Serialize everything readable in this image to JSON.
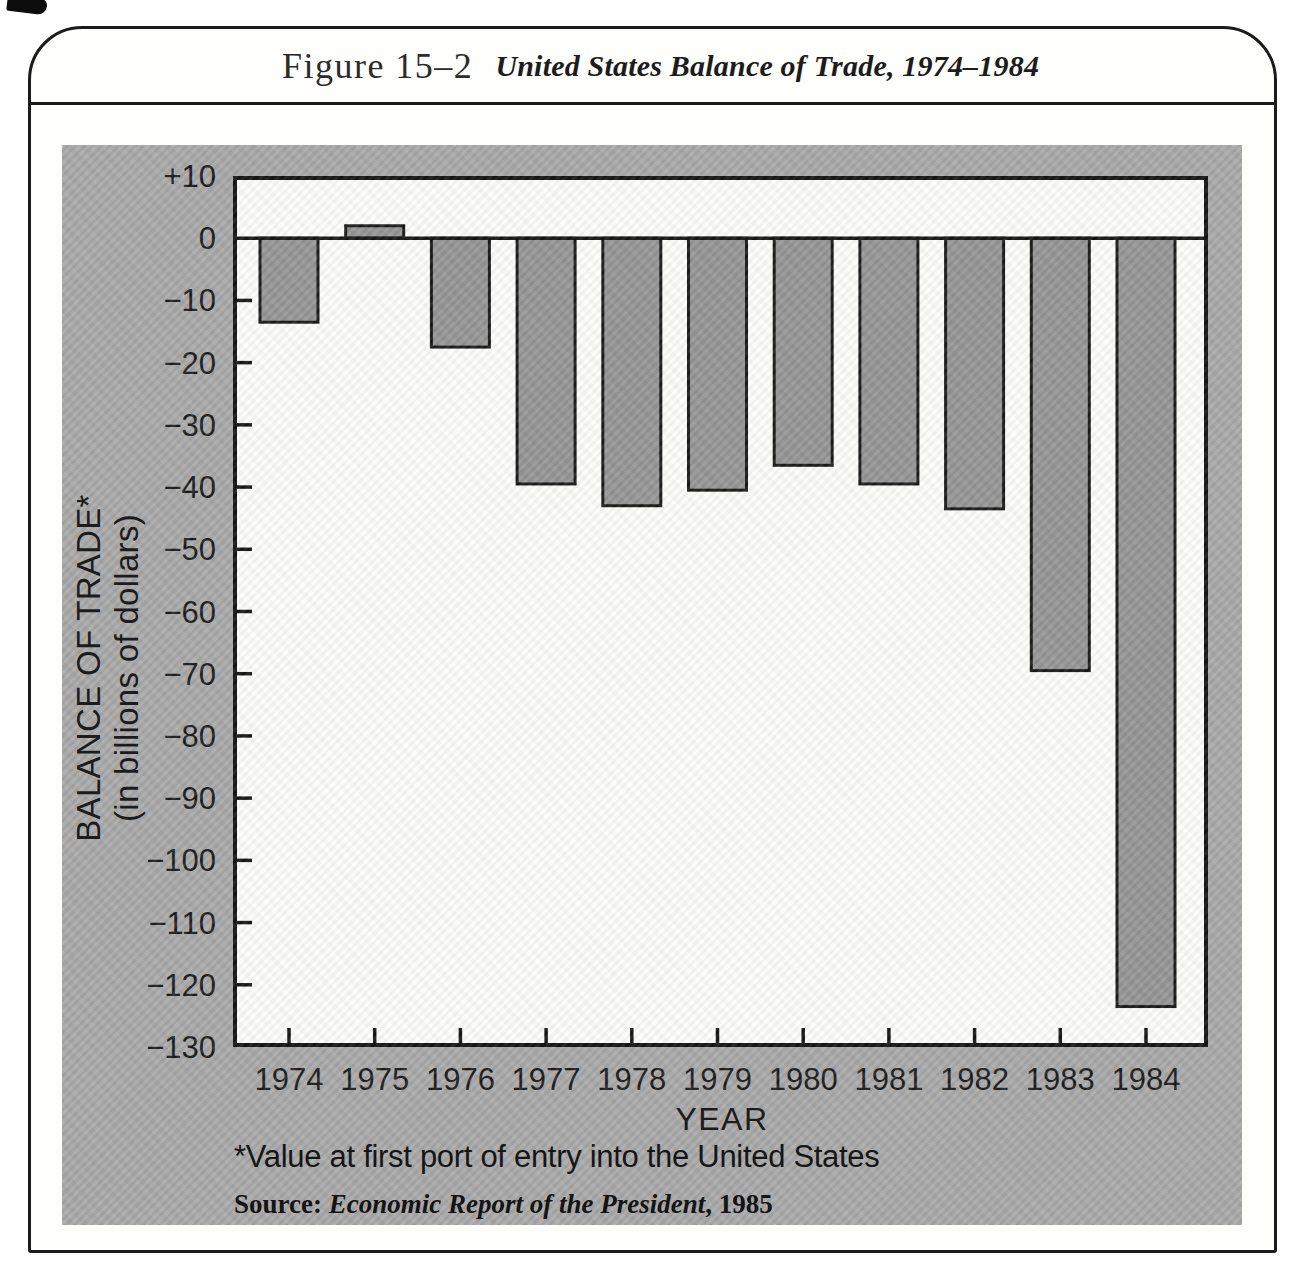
{
  "figure": {
    "label": "Figure 15–2",
    "title": "United States Balance of Trade, 1974–1984"
  },
  "chart_data": {
    "type": "bar",
    "title": "United States Balance of Trade, 1974–1984",
    "categories": [
      "1974",
      "1975",
      "1976",
      "1977",
      "1978",
      "1979",
      "1980",
      "1981",
      "1982",
      "1983",
      "1984"
    ],
    "values": [
      -13.5,
      2,
      -17.5,
      -39.5,
      -43,
      -40.5,
      -36.5,
      -39.5,
      -43.5,
      -69.5,
      -123.5
    ],
    "units": "billions of dollars",
    "xlabel": "YEAR",
    "ylabel_line1": "BALANCE OF TRADE*",
    "ylabel_line2": "(in billions of dollars)",
    "ylim": [
      -130,
      10
    ],
    "yticks": [
      {
        "v": 10,
        "label": "+10"
      },
      {
        "v": 0,
        "label": "0"
      },
      {
        "v": -10,
        "label": "−10"
      },
      {
        "v": -20,
        "label": "−20"
      },
      {
        "v": -30,
        "label": "−30"
      },
      {
        "v": -40,
        "label": "−40"
      },
      {
        "v": -50,
        "label": "−50"
      },
      {
        "v": -60,
        "label": "−60"
      },
      {
        "v": -70,
        "label": "−70"
      },
      {
        "v": -80,
        "label": "−80"
      },
      {
        "v": -90,
        "label": "−90"
      },
      {
        "v": -100,
        "label": "−100"
      },
      {
        "v": -110,
        "label": "−110"
      },
      {
        "v": -120,
        "label": "−120"
      },
      {
        "v": -130,
        "label": "−130"
      }
    ],
    "grid": "off",
    "legend": "none",
    "bar_color": "#969696",
    "bar_outline": "#1a1a1a",
    "panel_color": "#a9a9a9",
    "plot_bg": "#fdfdfb",
    "axis_color": "#151515"
  },
  "footnote": "*Value at first port of entry into the United States",
  "source": {
    "prefix": "Source: ",
    "work": "Economic Report of the President",
    "suffix": ", 1985"
  }
}
